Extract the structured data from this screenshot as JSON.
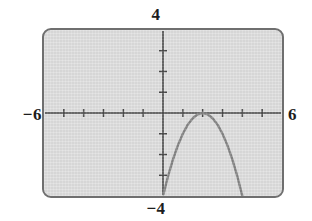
{
  "screen": {
    "label_top": "4",
    "label_bottom": "−4",
    "label_left": "−6",
    "label_right": "6",
    "frame_color": "#6f6f6f",
    "background_color": "#dedede",
    "axis_color": "#3a3a3a",
    "curve_color": "#7b7b7b"
  },
  "chart_data": {
    "type": "line",
    "title": "",
    "xlabel": "",
    "ylabel": "",
    "xlim": [
      -6,
      6
    ],
    "ylim": [
      -4,
      4
    ],
    "grid": false,
    "legend": "none",
    "x_tick_labels": [
      "−6",
      "6"
    ],
    "y_tick_labels": [
      "−4",
      "4"
    ],
    "x_ticks": [
      -5,
      -4,
      -3,
      -2,
      -1,
      1,
      2,
      3,
      4,
      5
    ],
    "y_ticks": [
      -3,
      -2,
      -1,
      1,
      2,
      3
    ],
    "tick_spacing_x": 1,
    "tick_spacing_y": 1,
    "series": [
      {
        "name": "parabola",
        "equation": "y = -(x - 2)^2",
        "vertex": [
          2,
          0
        ],
        "opens": "down",
        "color": "#7b7b7b",
        "x": [
          0.02,
          0.25,
          0.5,
          0.75,
          1,
          1.25,
          1.5,
          1.75,
          2,
          2.25,
          2.5,
          2.75,
          3,
          3.25,
          3.5,
          3.75,
          4
        ],
        "y": [
          -3.92,
          -3.06,
          -2.25,
          -1.56,
          -1,
          -0.56,
          -0.25,
          -0.06,
          0,
          -0.06,
          -0.25,
          -0.56,
          -1,
          -1.56,
          -2.25,
          -3.06,
          -4
        ]
      }
    ]
  }
}
